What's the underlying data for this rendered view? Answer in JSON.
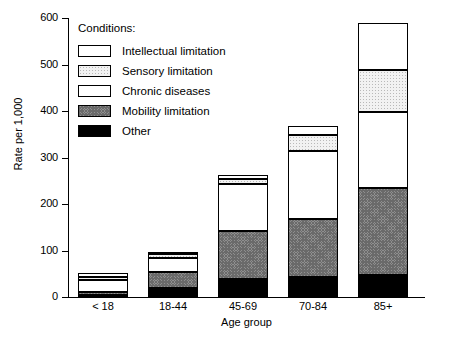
{
  "chart_data": {
    "type": "bar",
    "subtype": "stacked",
    "title": "",
    "xlabel": "Age group",
    "ylabel": "Rate per 1,000",
    "categories": [
      "< 18",
      "18-44",
      "45-69",
      "70-84",
      "85+"
    ],
    "ylim": [
      0,
      600
    ],
    "yticks": [
      0,
      100,
      200,
      300,
      400,
      500,
      600
    ],
    "ytick_labels": [
      "0",
      "100",
      "200",
      "300",
      "400",
      "500",
      "600"
    ],
    "grid": false,
    "legend_title": "Conditions:",
    "legend_position": "upper left (inside plot area)",
    "stack_order_bottom_to_top": [
      "Other",
      "Mobility limitation",
      "Chronic diseases",
      "Sensory limitation",
      "Intellectual limitation"
    ],
    "series": [
      {
        "name": "Other",
        "pattern": "solid-black",
        "values": [
          5,
          20,
          38,
          44,
          47
        ]
      },
      {
        "name": "Mobility limitation",
        "pattern": "dark-checker",
        "values": [
          5,
          33,
          104,
          124,
          187
        ]
      },
      {
        "name": "Chronic diseases",
        "pattern": "fine-grid",
        "values": [
          26,
          31,
          100,
          146,
          164
        ]
      },
      {
        "name": "Sensory limitation",
        "pattern": "light-stipple",
        "values": [
          6,
          8,
          11,
          35,
          90
        ]
      },
      {
        "name": "Intellectual limitation",
        "pattern": "white-empty",
        "values": [
          10,
          5,
          10,
          18,
          101
        ]
      }
    ],
    "totals": [
      52,
      97,
      263,
      367,
      589
    ]
  },
  "legend": {
    "title": "Conditions:",
    "items": [
      {
        "label": "Intellectual limitation",
        "pattern": "white-empty"
      },
      {
        "label": "Sensory limitation",
        "pattern": "light-stipple"
      },
      {
        "label": "Chronic diseases",
        "pattern": "fine-grid"
      },
      {
        "label": "Mobility limitation",
        "pattern": "dark-checker"
      },
      {
        "label": "Other",
        "pattern": "solid-black"
      }
    ]
  },
  "axes": {
    "y_title": "Rate per 1,000",
    "x_title": "Age group",
    "y_labels": [
      "600",
      "500",
      "400",
      "300",
      "200",
      "100",
      "0"
    ],
    "x_labels": [
      "< 18",
      "18-44",
      "45-69",
      "70-84",
      "85+"
    ]
  },
  "colors": {
    "axis": "#000000",
    "text": "#000000",
    "background": "#ffffff",
    "mobility_fill": "#8f8f8f",
    "sensory_fill": "#f2f2f2",
    "other_fill": "#000000"
  }
}
